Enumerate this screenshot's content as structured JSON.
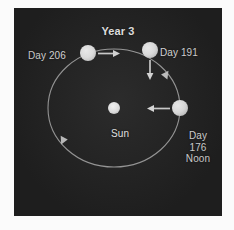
{
  "figure": {
    "title": "Year 3",
    "background_color": "#242424",
    "panel_border_color": "#b9b9b9",
    "text_color": "#e9e9e9",
    "orbit_color": "#9a9a9a",
    "body_color": "#e6e6e6",
    "sun_color": "#d9d9d9"
  },
  "diagram": {
    "type": "orbital-diagram",
    "center_body": {
      "name": "sun-body",
      "label": "Sun",
      "cx": 100,
      "cy": 100,
      "r": 6
    },
    "orbit": {
      "cx": 100,
      "cy": 100,
      "rx": 66,
      "ry": 59,
      "direction": "counterclockwise"
    },
    "planets": [
      {
        "name": "planet-day-206",
        "label": "Day 206",
        "label_lines": [
          "Day 206"
        ],
        "cx": 74,
        "cy": 45,
        "r": 8,
        "spin_arrow": "right"
      },
      {
        "name": "planet-day-191",
        "label": "Day 191",
        "label_lines": [
          "Day 191"
        ],
        "cx": 136,
        "cy": 42,
        "r": 8,
        "spin_arrow": "down"
      },
      {
        "name": "planet-day-176-noon",
        "label": "Day 176 Noon",
        "label_lines": [
          "Day",
          "176",
          "Noon"
        ],
        "cx": 166,
        "cy": 100,
        "r": 8,
        "spin_arrow": "left"
      }
    ],
    "orbit_direction_markers": [
      {
        "name": "orbit-arrow-right",
        "x": 152,
        "y": 67
      },
      {
        "name": "orbit-arrow-lower-left",
        "x": 49,
        "y": 134
      }
    ]
  },
  "labels": {
    "title": "Year 3",
    "day206": "Day 206",
    "day191": "Day 191",
    "day176_line1": "Day",
    "day176_line2": "176",
    "day176_line3": "Noon",
    "sun": "Sun"
  }
}
